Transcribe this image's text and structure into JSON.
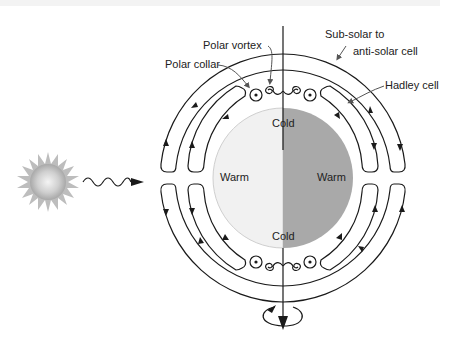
{
  "diagram": {
    "labels": {
      "sub_solar_line1": "Sub-solar to",
      "sub_solar_line2": "anti-solar cell",
      "hadley_cell": "Hadley cell",
      "polar_vortex": "Polar vortex",
      "polar_collar": "Polar collar"
    },
    "planet": {
      "top_label": "Cold",
      "bottom_label": "Cold",
      "left_label": "Warm",
      "right_label": "Warm",
      "day_side_color": "#f1f1f1",
      "night_side_color": "#a9a9a9"
    },
    "icons": {
      "star": "sun-icon",
      "radiation": "wavy-arrow-icon",
      "rotation": "rotation-arrow-icon"
    }
  }
}
